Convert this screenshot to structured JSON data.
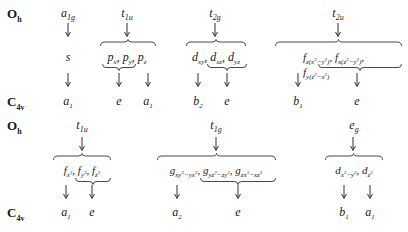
{
  "diagram": {
    "type": "group-theory correlation diagram",
    "top": {
      "parent_group": {
        "symbol": "O",
        "subscript": "h"
      },
      "child_group": {
        "symbol": "C",
        "subscript": "4v"
      },
      "irreps": [
        {
          "name": "a",
          "sub": "1g",
          "orbitals": [
            "s"
          ],
          "children": [
            "a1"
          ]
        },
        {
          "name": "t",
          "sub": "1u",
          "orbitals": [
            "p_x",
            "p_y",
            "p_z"
          ],
          "children": [
            "e",
            "a1"
          ]
        },
        {
          "name": "t",
          "sub": "2g",
          "orbitals": [
            "d_xy",
            "d_xz",
            "d_yz"
          ],
          "children": [
            "b2",
            "e"
          ]
        },
        {
          "name": "t",
          "sub": "2u",
          "orbitals": [
            "f_z(x2-y2)",
            "f_x(z2-y2)",
            "f_y(z2-x2)"
          ],
          "children": [
            "b1",
            "e"
          ]
        }
      ]
    },
    "bottom": {
      "parent_group": {
        "symbol": "O",
        "subscript": "h"
      },
      "child_group": {
        "symbol": "C",
        "subscript": "4v"
      },
      "irreps": [
        {
          "name": "t",
          "sub": "1u",
          "orbitals": [
            "f_x3",
            "f_y3",
            "f_z3"
          ],
          "children": [
            "a1",
            "e"
          ]
        },
        {
          "name": "t",
          "sub": "1g",
          "orbitals": [
            "g_xy3-yx3",
            "g_yz3-zy3",
            "g_zx3-xz3"
          ],
          "children": [
            "a2",
            "e"
          ]
        },
        {
          "name": "e",
          "sub": "g",
          "orbitals": [
            "d_x2-y2",
            "d_z2"
          ],
          "children": [
            "b1",
            "a1"
          ]
        }
      ]
    }
  },
  "labels": {
    "Oh": "O",
    "Oh_sub": "h",
    "C4v": "C",
    "C4v_sub": "4v",
    "a1g": "a",
    "a1g_sub": "1g",
    "t1u": "t",
    "t1u_sub": "1u",
    "t2g": "t",
    "t2g_sub": "2g",
    "t2u": "t",
    "t2u_sub": "2u",
    "t1g": "t",
    "t1g_sub": "1g",
    "eg": "e",
    "eg_sub": "g",
    "s": "s",
    "p": "p",
    "x": "x",
    "y": "y",
    "z": "z",
    "d": "d",
    "xy": "xy",
    "xz": "xz",
    "yz": "yz",
    "f": "f",
    "g": "g",
    "comma": ",",
    "a": "a",
    "b": "b",
    "e": "e",
    "one": "1",
    "two": "2",
    "f1_sub_a": "z(x",
    "f1_sub_b": "2",
    "f1_sub_c": "−y",
    "f1_sub_d": "2",
    "f1_sub_e": ")",
    "f2_sub_a": "x(z",
    "f2_sub_b": "2",
    "f2_sub_c": "−y",
    "f2_sub_d": "2",
    "f2_sub_e": ")",
    "f3_sub_a": "y(z",
    "f3_sub_b": "2",
    "f3_sub_c": "−x",
    "f3_sub_d": "2",
    "f3_sub_e": ")",
    "fx3_a": "x",
    "fy3_a": "y",
    "fz3_a": "z",
    "three": "3",
    "g1_a": "xy",
    "g1_b": "3",
    "g1_c": "−yx",
    "g1_d": "3",
    "g2_a": "yz",
    "g2_b": "3",
    "g2_c": "−zy",
    "g2_d": "3",
    "g3_a": "zx",
    "g3_b": "3",
    "g3_c": "−xz",
    "g3_d": "3",
    "dx2y2_a": "x",
    "dx2y2_b": "2",
    "dx2y2_c": "−y",
    "dx2y2_d": "2",
    "dz2_a": "z",
    "dz2_b": "2"
  }
}
